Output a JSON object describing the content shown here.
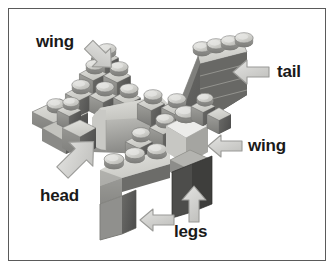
{
  "figure": {
    "type": "annotated-photograph",
    "background_color": "#ffffff",
    "border_color": "#5a5a5a",
    "palette": {
      "brick_light": "#d8d8d4",
      "brick_mid": "#a9a9a5",
      "brick_dark": "#6f6f6c",
      "brick_darker": "#4e4e4c",
      "arrow_fill": "#d4d4d2",
      "arrow_stroke": "#8f8f8d",
      "label_color": "#1a1a1a"
    }
  },
  "annotations": [
    {
      "id": "wing-top-left",
      "label": "wing",
      "label_x": 36,
      "label_y": 33,
      "arrow_direction": "down-right",
      "arrow_x": 82,
      "arrow_y": 40
    },
    {
      "id": "tail-right",
      "label": "tail",
      "label_x": 277,
      "label_y": 63,
      "arrow_direction": "left",
      "arrow_x": 231,
      "arrow_y": 58
    },
    {
      "id": "wing-right",
      "label": "wing",
      "label_x": 248,
      "label_y": 137,
      "arrow_direction": "left",
      "arrow_x": 206,
      "arrow_y": 133
    },
    {
      "id": "head-left",
      "label": "head",
      "label_x": 40,
      "label_y": 187,
      "arrow_direction": "up-right",
      "arrow_x": 58,
      "arrow_y": 133
    },
    {
      "id": "legs-left-arrow",
      "label": "legs",
      "label_x": 174,
      "label_y": 223,
      "arrow_direction": "left",
      "arrow_x": 138,
      "arrow_y": 207
    },
    {
      "id": "legs-up-arrow",
      "label": "",
      "arrow_direction": "up",
      "arrow_x": 180,
      "arrow_y": 186
    }
  ]
}
